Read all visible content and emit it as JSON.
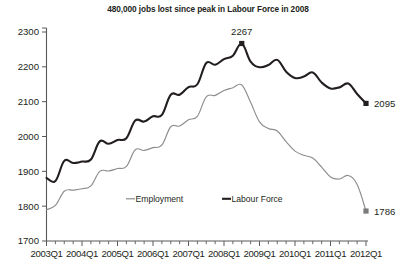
{
  "chart_data": {
    "type": "line",
    "title": "480,000 jobs lost since peak in Labour Force in 2008",
    "xlabel": "",
    "ylabel": "",
    "ylim": [
      1700,
      2300
    ],
    "yticks": [
      1700,
      1800,
      1900,
      2000,
      2100,
      2200,
      2300
    ],
    "grid": false,
    "legend_position": "bottom-center",
    "x": [
      "2003Q1",
      "2003Q2",
      "2003Q3",
      "2003Q4",
      "2004Q1",
      "2004Q2",
      "2004Q3",
      "2004Q4",
      "2005Q1",
      "2005Q2",
      "2005Q3",
      "2005Q4",
      "2006Q1",
      "2006Q2",
      "2006Q3",
      "2006Q4",
      "2007Q1",
      "2007Q2",
      "2007Q3",
      "2007Q4",
      "2008Q1",
      "2008Q2",
      "2008Q3",
      "2008Q4",
      "2009Q1",
      "2009Q2",
      "2009Q3",
      "2009Q4",
      "2010Q1",
      "2010Q2",
      "2010Q3",
      "2010Q4",
      "2011Q1",
      "2011Q2",
      "2011Q3",
      "2011Q4",
      "2012Q1"
    ],
    "xtick_labels": [
      "2003Q1",
      "2004Q1",
      "2005Q1",
      "2006Q1",
      "2007Q1",
      "2008Q1",
      "2009Q1",
      "2010Q1",
      "2011Q1",
      "2012Q1"
    ],
    "series": [
      {
        "name": "Labour Force",
        "color": "#231f20",
        "values": [
          1881,
          1872,
          1930,
          1924,
          1928,
          1934,
          1986,
          1979,
          1990,
          1995,
          2046,
          2043,
          2058,
          2062,
          2120,
          2120,
          2142,
          2150,
          2211,
          2206,
          2222,
          2232,
          2267,
          2215,
          2199,
          2205,
          2220,
          2186,
          2168,
          2172,
          2184,
          2155,
          2138,
          2141,
          2152,
          2122,
          2095
        ]
      },
      {
        "name": "Employment",
        "color": "#8d8d8d",
        "values": [
          1790,
          1802,
          1843,
          1846,
          1850,
          1858,
          1900,
          1901,
          1908,
          1914,
          1962,
          1960,
          1968,
          1975,
          2028,
          2030,
          2048,
          2058,
          2114,
          2118,
          2132,
          2140,
          2148,
          2098,
          2042,
          2023,
          2016,
          1985,
          1958,
          1946,
          1938,
          1912,
          1884,
          1878,
          1888,
          1862,
          1786
        ]
      }
    ],
    "annotations": [
      {
        "name": "peak-label",
        "text": "2267",
        "series": "Labour Force",
        "x": "2008Q3",
        "value": 2267
      },
      {
        "name": "endpoint-labour-force",
        "text": "2095",
        "series": "Labour Force",
        "x": "2012Q1",
        "value": 2095
      },
      {
        "name": "endpoint-employment",
        "text": "1786",
        "series": "Employment",
        "x": "2012Q1",
        "value": 1786
      }
    ],
    "legend": [
      {
        "label": "Employment",
        "color": "#8d8d8d"
      },
      {
        "label": "Labour Force",
        "color": "#231f20"
      }
    ]
  },
  "top_crop": {
    "stub_text": ""
  }
}
